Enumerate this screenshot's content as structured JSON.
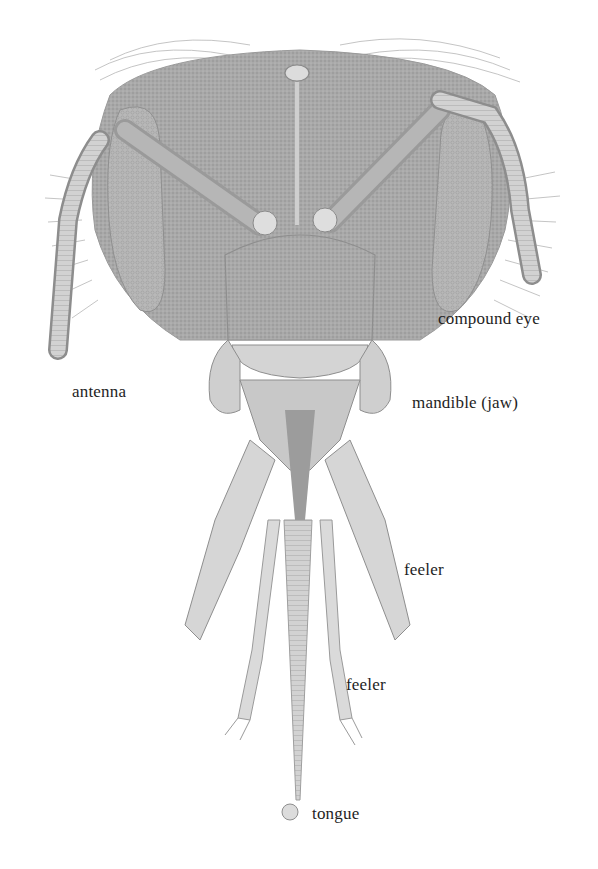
{
  "diagram": {
    "colors": {
      "background": "#ffffff",
      "illustration": "#9a9a9a",
      "illustration_dark": "#7d7d7d",
      "label_text": "#1e1e1e"
    },
    "labels": [
      {
        "id": "compound-eye",
        "text": "compound eye",
        "x": 438,
        "y": 310
      },
      {
        "id": "antenna",
        "text": "antenna",
        "x": 72,
        "y": 383
      },
      {
        "id": "mandible",
        "text": "mandible (jaw)",
        "x": 412,
        "y": 394
      },
      {
        "id": "feeler-upper",
        "text": "feeler",
        "x": 404,
        "y": 561
      },
      {
        "id": "feeler-lower",
        "text": "feeler",
        "x": 346,
        "y": 676
      },
      {
        "id": "tongue",
        "text": "tongue",
        "x": 312,
        "y": 805
      }
    ]
  }
}
